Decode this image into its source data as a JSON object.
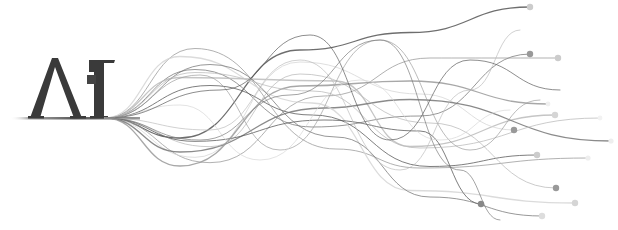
{
  "logo": {
    "text": "AI",
    "letters": [
      "Λ",
      "I"
    ],
    "color": "#3a3a3a",
    "accent_square_color": "#444444"
  },
  "graphic": {
    "name": "flowing-wave-lines",
    "baseline_y": 118,
    "origin_x": 105,
    "line_colors": [
      "#555555",
      "#777777",
      "#999999",
      "#bbbbbb",
      "#d5d5d5"
    ],
    "end_dots": [
      {
        "x": 530,
        "y": 7,
        "r": 3.2,
        "color": "#cccccc"
      },
      {
        "x": 530,
        "y": 54,
        "r": 3.2,
        "color": "#999999"
      },
      {
        "x": 558,
        "y": 58,
        "r": 3.2,
        "color": "#cccccc"
      },
      {
        "x": 555,
        "y": 115,
        "r": 3.2,
        "color": "#d5d5d5"
      },
      {
        "x": 514,
        "y": 130,
        "r": 3.2,
        "color": "#999999"
      },
      {
        "x": 537,
        "y": 155,
        "r": 3.2,
        "color": "#cccccc"
      },
      {
        "x": 611,
        "y": 141,
        "r": 2.6,
        "color": "#eeeeee"
      },
      {
        "x": 588,
        "y": 158,
        "r": 2.6,
        "color": "#eeeeee"
      },
      {
        "x": 556,
        "y": 188,
        "r": 3.2,
        "color": "#999999"
      },
      {
        "x": 575,
        "y": 203,
        "r": 3.2,
        "color": "#d5d5d5"
      },
      {
        "x": 481,
        "y": 204,
        "r": 3.2,
        "color": "#888888"
      },
      {
        "x": 542,
        "y": 216,
        "r": 3.2,
        "color": "#dddddd"
      },
      {
        "x": 548,
        "y": 104,
        "r": 2.4,
        "color": "#f0f0f0"
      },
      {
        "x": 600,
        "y": 118,
        "r": 2.4,
        "color": "#f2f2f2"
      }
    ]
  }
}
